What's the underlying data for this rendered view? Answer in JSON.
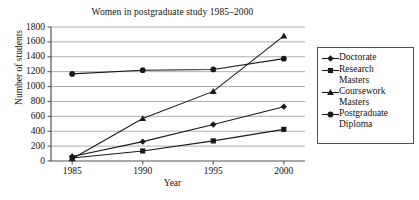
{
  "chart_data": {
    "type": "line",
    "title": "Women in postgraduate study 1985–2000",
    "xlabel": "Year",
    "ylabel": "Number of students",
    "categories": [
      "1985",
      "1990",
      "1995",
      "2000"
    ],
    "x": [
      1985,
      1990,
      1995,
      2000
    ],
    "xlim": [
      1983.5,
      2001.5
    ],
    "ylim": [
      0,
      1800
    ],
    "yticks": [
      0,
      200,
      400,
      600,
      800,
      1000,
      1200,
      1400,
      1600,
      1800
    ],
    "ytick_labels": [
      "0",
      "200",
      "400",
      "600",
      "800",
      "1000",
      "1200",
      "1400",
      "1600",
      "1800"
    ],
    "xticks": [
      1985,
      1990,
      1995,
      2000
    ],
    "xtick_labels": [
      "1985",
      "1990",
      "1995",
      "2000"
    ],
    "grid": "horizontal",
    "legend_position": "right-outside",
    "series": [
      {
        "name": "Doctorate",
        "marker": "diamond",
        "color": "#1a1a1a",
        "values": [
          60,
          260,
          490,
          730
        ]
      },
      {
        "name": "Research Masters",
        "marker": "square",
        "color": "#1a1a1a",
        "values": [
          40,
          135,
          270,
          425
        ]
      },
      {
        "name": "Coursework Masters",
        "marker": "triangle",
        "color": "#1a1a1a",
        "values": [
          30,
          570,
          935,
          1680
        ]
      },
      {
        "name": "Postgraduate Diploma",
        "marker": "circle",
        "color": "#1a1a1a",
        "values": [
          1170,
          1220,
          1230,
          1375
        ]
      }
    ]
  },
  "legend": {
    "entries": [
      {
        "label": "Doctorate",
        "marker": "diamond"
      },
      {
        "label": "Research\nMasters",
        "marker": "square"
      },
      {
        "label": "Coursework\nMasters",
        "marker": "triangle"
      },
      {
        "label": "Postgraduate\nDiploma",
        "marker": "circle"
      }
    ]
  },
  "style": {
    "axis_color": "#555555",
    "grid_color": "#999999",
    "line_color": "#1a1a1a",
    "background": "#ffffff"
  }
}
